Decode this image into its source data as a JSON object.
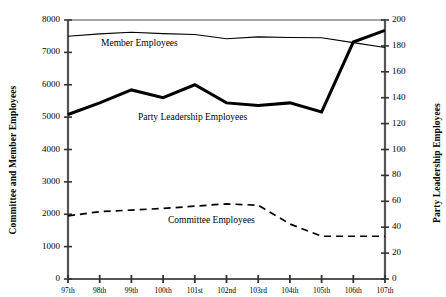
{
  "chart_data": {
    "type": "line",
    "title": "",
    "xlabel": "",
    "ylabel": "Committee and Member Employees",
    "ylabel_right": "Party Leadership Employees",
    "categories": [
      "97th",
      "98th",
      "99th",
      "100th",
      "101st",
      "102nd",
      "103rd",
      "104th",
      "105th",
      "106th",
      "107th"
    ],
    "ylim": [
      0,
      8000
    ],
    "ylim_right": [
      0,
      200
    ],
    "yticks": [
      0,
      1000,
      2000,
      3000,
      4000,
      5000,
      6000,
      7000,
      8000
    ],
    "yticks_right": [
      0,
      20,
      40,
      60,
      80,
      100,
      120,
      140,
      160,
      180,
      200
    ],
    "grid": false,
    "legend": "inline-annotations",
    "series": [
      {
        "name": "Member Employees",
        "axis": "left",
        "style": "thin-solid",
        "color": "#000000",
        "values": [
          7500,
          7570,
          7620,
          7580,
          7550,
          7420,
          7480,
          7460,
          7450,
          7300,
          7150
        ]
      },
      {
        "name": "Party Leadership Employees",
        "axis": "right",
        "style": "thick-solid",
        "color": "#000000",
        "values": [
          127,
          136,
          146,
          140,
          150,
          136,
          134,
          136,
          129,
          183,
          192
        ]
      },
      {
        "name": "Committee Employees",
        "axis": "left",
        "style": "dashed",
        "color": "#000000",
        "values": [
          1950,
          2080,
          2130,
          2180,
          2250,
          2320,
          2280,
          1700,
          1320,
          1320,
          1320
        ]
      }
    ],
    "annotations": [
      {
        "text": "Member Employees",
        "series": "Member Employees"
      },
      {
        "text": "Party Leadership Employees",
        "series": "Party Leadership Employees"
      },
      {
        "text": "Committee Employees",
        "series": "Committee Employees"
      }
    ]
  },
  "axes": {
    "left_title": "Committee and Member Employees",
    "right_title": "Party Leadership Employees"
  }
}
